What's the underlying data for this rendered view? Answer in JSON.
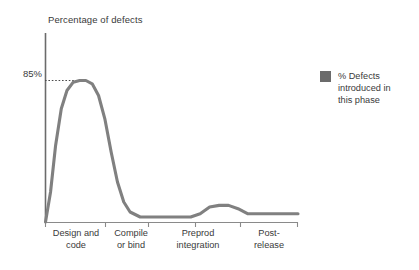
{
  "chart_data": {
    "type": "line",
    "title": "Percentage of defects",
    "xlabel": "",
    "ylabel": "",
    "grid": false,
    "legend_position": "right",
    "xlim": [
      0,
      4
    ],
    "ylim": [
      0,
      100
    ],
    "categories": [
      "Design and\ncode",
      "Compile\nor bind",
      "Preprod\nintegration",
      "Post-\nrelease"
    ],
    "ytick_labels": [
      "85%"
    ],
    "ytick_values": [
      85
    ],
    "annotations": [
      {
        "label": "85%",
        "value": 85,
        "style": "dotted-leader-line"
      }
    ],
    "series": [
      {
        "name": "% Defects\nintroduced in\nthis phase",
        "color": "#808080",
        "x": [
          0.0,
          0.08,
          0.16,
          0.25,
          0.34,
          0.44,
          0.54,
          0.64,
          0.74,
          0.84,
          0.94,
          1.04,
          1.14,
          1.24,
          1.34,
          1.5,
          1.7,
          1.9,
          2.1,
          2.3,
          2.45,
          2.6,
          2.75,
          2.9,
          3.05,
          3.2,
          3.4,
          3.6,
          3.8,
          4.0
        ],
        "values": [
          0,
          18,
          46,
          68,
          79,
          84,
          85,
          85,
          83,
          76,
          62,
          42,
          24,
          12,
          6,
          3,
          3,
          3,
          3,
          3,
          5,
          9,
          10,
          10,
          8,
          5,
          5,
          5,
          5,
          5
        ]
      }
    ],
    "colors": {
      "series": "#808080",
      "axis": "#6b6b6b",
      "text": "#3a3a3a",
      "legend_swatch": "#6b6b6b",
      "background": "#ffffff"
    }
  },
  "legend": {
    "entries": [
      {
        "label": "% Defects\nintroduced in\nthis phase",
        "color": "#6b6b6b"
      }
    ]
  }
}
